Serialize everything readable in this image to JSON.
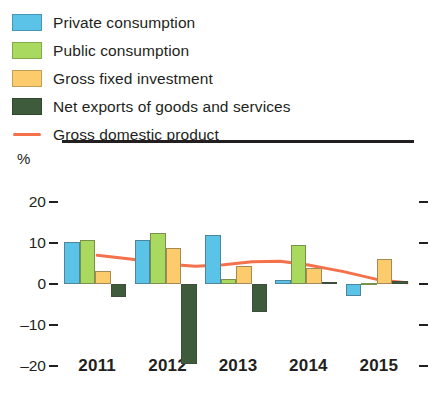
{
  "legend": {
    "items": [
      {
        "label": "Private consumption",
        "color": "#5cc3e8",
        "marker": "square"
      },
      {
        "label": "Public consumption",
        "color": "#a9d95e",
        "marker": "square"
      },
      {
        "label": "Gross fixed investment",
        "color": "#fbcb6c",
        "marker": "square"
      },
      {
        "label": "Net exports of goods and services",
        "color": "#3e5c3b",
        "marker": "square"
      },
      {
        "label": "Gross domestic product",
        "color": "#f4714c",
        "marker": "line"
      }
    ]
  },
  "axes": {
    "y_unit_label": "%",
    "y_ticks": [
      "20",
      "10",
      "0",
      "–10",
      "–20"
    ],
    "x_ticks": [
      "2011",
      "2012",
      "2013",
      "2014",
      "2015"
    ]
  },
  "chart_data": {
    "type": "bar",
    "title": "",
    "subtitle": "",
    "xlabel": "",
    "ylabel": "%",
    "ylim": [
      -22,
      22
    ],
    "ytick_values": [
      20,
      10,
      0,
      -10,
      -20
    ],
    "grid": false,
    "legend_position": "above-plot",
    "categories": [
      "2011",
      "2012",
      "2013",
      "2014",
      "2015"
    ],
    "series": [
      {
        "name": "Private consumption",
        "type": "bar",
        "color": "#5cc3e8",
        "values": [
          10.3,
          10.6,
          12.0,
          1.0,
          -3.0
        ]
      },
      {
        "name": "Public consumption",
        "type": "bar",
        "color": "#a9d95e",
        "values": [
          10.8,
          12.5,
          1.2,
          9.4,
          0.3
        ]
      },
      {
        "name": "Gross fixed investment",
        "type": "bar",
        "color": "#fbcb6c",
        "values": [
          3.2,
          8.7,
          4.4,
          3.9,
          6.0
        ]
      },
      {
        "name": "Net exports of goods and services",
        "type": "bar",
        "color": "#3e5c3b",
        "values": [
          -3.2,
          -19.3,
          -6.8,
          0.5,
          0.7
        ]
      },
      {
        "name": "Gross domestic product",
        "type": "line",
        "color": "#f4714c",
        "x": [
          2011.0,
          2011.5,
          2012.0,
          2012.4,
          2012.8,
          2013.2,
          2013.6,
          2014.0,
          2014.5,
          2015.0,
          2015.4
        ],
        "values": [
          7.0,
          6.0,
          4.8,
          4.3,
          4.7,
          5.4,
          5.5,
          4.6,
          3.0,
          1.0,
          0.3
        ]
      }
    ]
  }
}
